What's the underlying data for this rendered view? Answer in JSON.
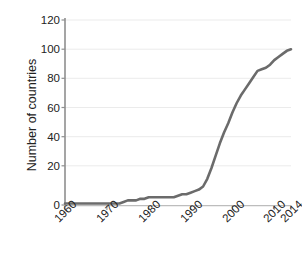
{
  "chart_data": {
    "type": "line",
    "title": "",
    "subtitle": "",
    "xlabel": "",
    "ylabel": "Number of countries",
    "xlim": [
      1960,
      2014
    ],
    "ylim": [
      0,
      120
    ],
    "grid": true,
    "legend": false,
    "line_color": "#6b6b6b",
    "axis_color": "#9a9a9a",
    "grid_color": "#ebebeb",
    "text_color": "#222222",
    "background": "#ffffff",
    "y_ticks": [
      0,
      20,
      40,
      60,
      80,
      100,
      120
    ],
    "y_tick_labels": [
      "0",
      "20",
      "40",
      "60",
      "80",
      "100",
      "120"
    ],
    "x_ticks": [
      1960,
      1970,
      1980,
      1990,
      2000,
      2010,
      2014
    ],
    "x_tick_labels": [
      "1960",
      "1970",
      "1980",
      "1990",
      "2000",
      "2010",
      "2014"
    ],
    "x": [
      1960,
      1961,
      1962,
      1963,
      1964,
      1965,
      1966,
      1967,
      1968,
      1969,
      1970,
      1971,
      1972,
      1973,
      1974,
      1975,
      1976,
      1977,
      1978,
      1979,
      1980,
      1981,
      1982,
      1983,
      1984,
      1985,
      1986,
      1987,
      1988,
      1989,
      1990,
      1991,
      1992,
      1993,
      1994,
      1995,
      1996,
      1997,
      1998,
      1999,
      2000,
      2001,
      2002,
      2003,
      2004,
      2005,
      2006,
      2007,
      2008,
      2009,
      2010,
      2011,
      2012,
      2013,
      2014
    ],
    "y": [
      1,
      1,
      1,
      1,
      1,
      1,
      1,
      1,
      1,
      1,
      1,
      1,
      1,
      1,
      2,
      3,
      3,
      3,
      4,
      4,
      5,
      5,
      5,
      5,
      5,
      5,
      5,
      6,
      7,
      7,
      8,
      9,
      10,
      12,
      17,
      24,
      32,
      40,
      47,
      53,
      60,
      66,
      71,
      75,
      79,
      83,
      87,
      88,
      89,
      91,
      94,
      96,
      98,
      100,
      101
    ],
    "series": [
      {
        "name": "Number of countries",
        "values": [
          1,
          1,
          1,
          1,
          1,
          1,
          1,
          1,
          1,
          1,
          1,
          1,
          1,
          1,
          2,
          3,
          3,
          3,
          4,
          4,
          5,
          5,
          5,
          5,
          5,
          5,
          5,
          6,
          7,
          7,
          8,
          9,
          10,
          12,
          17,
          24,
          32,
          40,
          47,
          53,
          60,
          66,
          71,
          75,
          79,
          83,
          87,
          88,
          89,
          91,
          94,
          96,
          98,
          100,
          101
        ]
      }
    ],
    "annotations": []
  }
}
